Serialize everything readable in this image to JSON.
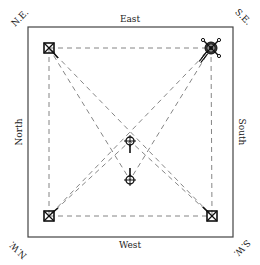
{
  "diagram": {
    "frame": {
      "x": 28,
      "y": 27,
      "width": 205,
      "height": 210,
      "stroke": "#444444"
    },
    "sides": {
      "top": "East",
      "bottom": "West",
      "left": "North",
      "right": "South"
    },
    "corners": {
      "top_left": "N.E.",
      "top_right": "S.E.",
      "bottom_left": "N.W.",
      "bottom_right": "S.W."
    },
    "markers": [
      {
        "id": "ne",
        "type": "square-x",
        "x": 49,
        "y": 48
      },
      {
        "id": "se",
        "type": "circle-cross-large",
        "x": 211,
        "y": 48
      },
      {
        "id": "nw",
        "type": "square-x",
        "x": 49,
        "y": 216
      },
      {
        "id": "sw",
        "type": "square-x",
        "x": 212,
        "y": 216
      },
      {
        "id": "center-top",
        "type": "circle-cross",
        "x": 130,
        "y": 141
      },
      {
        "id": "center-bottom",
        "type": "circle-cross",
        "x": 130,
        "y": 180
      }
    ],
    "line_color": "#777777"
  }
}
